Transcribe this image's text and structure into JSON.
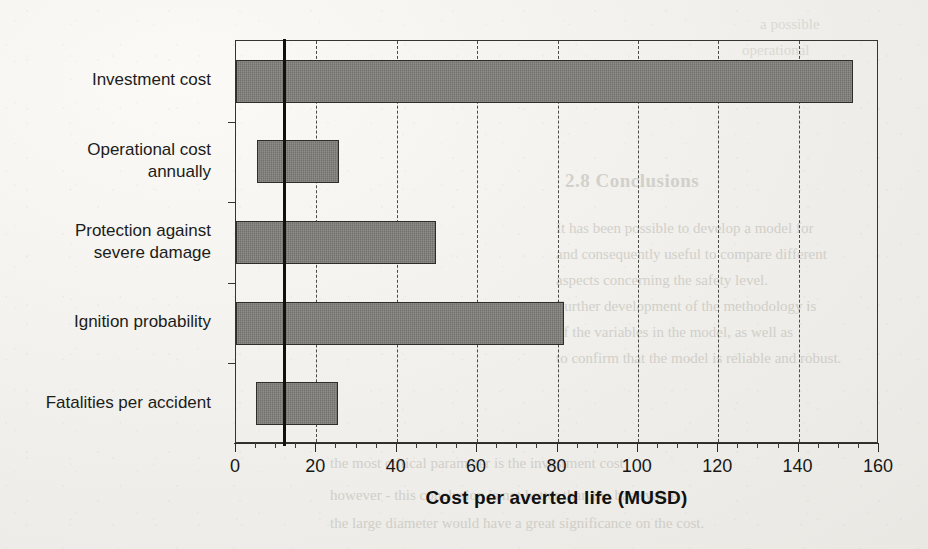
{
  "chart_data": {
    "type": "bar",
    "orientation": "horizontal",
    "title": "",
    "subtitle": "",
    "xlabel": "Cost per averted life (MUSD)",
    "ylabel": "",
    "xlim": [
      0,
      160
    ],
    "xtick_step": 20,
    "xminor_step": 5,
    "xticks": [
      "0",
      "20",
      "40",
      "60",
      "80",
      "100",
      "120",
      "140",
      "160"
    ],
    "grid": "vertical-dashed-major",
    "legend": "none",
    "bar_fill_color": "#7e7d78",
    "bar_border_color": "#2e2d29",
    "reference_line": {
      "label": "base case",
      "value": 11.8,
      "color": "#111110",
      "orientation": "vertical"
    },
    "categories": [
      "Investment cost",
      "Operational cost annually",
      "Protection against severe damage",
      "Ignition probability",
      "Fatalities per accident"
    ],
    "category_labels": [
      [
        "Investment cost"
      ],
      [
        "Operational cost",
        "annually"
      ],
      [
        "Protection against",
        "severe damage"
      ],
      [
        "Ignition probability"
      ],
      [
        "Fatalities per accident"
      ]
    ],
    "bars": [
      {
        "category": "Investment cost",
        "start": 0.0,
        "end": 153.5,
        "span": 153.5
      },
      {
        "category": "Operational cost annually",
        "start": 5.2,
        "end": 25.6,
        "span": 20.4
      },
      {
        "category": "Protection against severe damage",
        "start": 0.0,
        "end": 49.8,
        "span": 49.8
      },
      {
        "category": "Ignition probability",
        "start": 0.0,
        "end": 81.6,
        "span": 81.6
      },
      {
        "category": "Fatalities per accident",
        "start": 5.0,
        "end": 25.4,
        "span": 20.4
      }
    ],
    "values": [
      153.5,
      25.6,
      49.8,
      81.6,
      25.4
    ]
  },
  "background_text": {
    "heading": "2.8 Conclusions",
    "lines": [
      "It has been possible to develop a model for",
      "and consequently useful to compare different",
      "aspects concerning the safety level.",
      "Further development of the methodology is",
      "of the variables in the model, as well as",
      "to confirm that the model is reliable and robust."
    ],
    "lines_lower": [
      "the most critical parameter is the investment cost",
      "however - this conclusion is not better than the base value.",
      "the large diameter would have a great significance on the cost."
    ],
    "right_fragments": [
      "a possible",
      "operational"
    ]
  }
}
